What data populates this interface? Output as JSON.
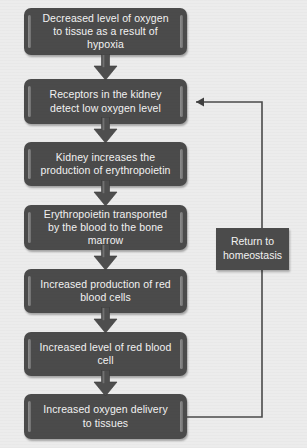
{
  "diagram": {
    "colors": {
      "box_fill": "#4b4b4b",
      "box_text": "#f2f2f2",
      "background": "#ececec",
      "bevel": "#8e8e8e",
      "connector": "#4a4a4a"
    },
    "nodes": [
      {
        "id": "n1",
        "label": "Decreased level of oxygen to tissue as a result of hypoxia"
      },
      {
        "id": "n2",
        "label": "Receptors in the kidney detect low oxygen level"
      },
      {
        "id": "n3",
        "label": "Kidney increases the production of erythropoietin"
      },
      {
        "id": "n4",
        "label": "Erythropoietin transported by the blood to the bone marrow"
      },
      {
        "id": "n5",
        "label": "Increased production of red blood cells"
      },
      {
        "id": "n6",
        "label": "Increased level of red blood cell"
      },
      {
        "id": "n7",
        "label": "Increased oxygen delivery to tissues"
      }
    ],
    "side_node": {
      "id": "s1",
      "label": "Return to homeostasis"
    },
    "arrows": [
      {
        "from": "n1",
        "to": "n2",
        "kind": "block-arrow-down"
      },
      {
        "from": "n2",
        "to": "n3",
        "kind": "block-arrow-down"
      },
      {
        "from": "n3",
        "to": "n4",
        "kind": "block-arrow-down"
      },
      {
        "from": "n4",
        "to": "n5",
        "kind": "block-arrow-down"
      },
      {
        "from": "n5",
        "to": "n6",
        "kind": "block-arrow-down"
      },
      {
        "from": "n6",
        "to": "n7",
        "kind": "block-arrow-down"
      }
    ],
    "feedback": {
      "from": "n7",
      "to": "n2",
      "kind": "line-arrow-left",
      "passes_through": "s1"
    }
  }
}
